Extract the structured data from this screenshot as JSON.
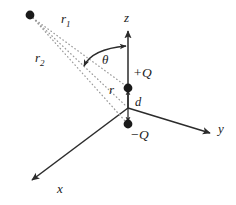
{
  "figure": {
    "type": "physics-diagram",
    "background_color": "#ffffff",
    "stroke_color": "#2b2b2b",
    "dotted_color": "#9a9a9a",
    "width": 236,
    "height": 205
  },
  "axes": [
    {
      "name": "z",
      "label": "z",
      "label_x": 124,
      "label_y": 11,
      "direction": "up",
      "tip_x": 128,
      "tip_y": 30,
      "origin_x": 128,
      "origin_y": 108
    },
    {
      "name": "y",
      "label": "y",
      "label_x": 218,
      "label_y": 122,
      "direction": "down-right",
      "tip_x": 212,
      "tip_y": 134,
      "origin_x": 128,
      "origin_y": 108
    },
    {
      "name": "x",
      "label": "x",
      "label_x": 57,
      "label_y": 182,
      "direction": "down-left",
      "tip_x": 30,
      "tip_y": 181,
      "origin_x": 128,
      "origin_y": 108
    }
  ],
  "charges": [
    {
      "name": "positive-charge",
      "label": "+Q",
      "sign": "+",
      "x": 128,
      "y": 88,
      "label_x": 133,
      "label_y": 66
    },
    {
      "name": "negative-charge",
      "label": "−Q",
      "sign": "−",
      "x": 128,
      "y": 124,
      "label_x": 130,
      "label_y": 128
    }
  ],
  "field_point": {
    "name": "field-point",
    "x": 30,
    "y": 15,
    "radius": 4.2
  },
  "distance_labels": [
    {
      "name": "r1",
      "base": "r",
      "sub": "1",
      "label_x": 62,
      "label_y": 13,
      "from": "field-point",
      "to": "positive-charge"
    },
    {
      "name": "r2",
      "base": "r",
      "sub": "2",
      "label_x": 36,
      "label_y": 52,
      "from": "field-point",
      "to": "negative-charge"
    },
    {
      "name": "r",
      "base": "r",
      "sub": "",
      "label_x": 109,
      "label_y": 83,
      "from": "field-point",
      "to": "origin"
    }
  ],
  "angle": {
    "name": "theta",
    "label": "θ",
    "label_x": 103,
    "label_y": 54,
    "arc_from_x": 84,
    "arc_from_y": 65,
    "arc_to_x": 126,
    "arc_to_y": 46
  },
  "separation": {
    "name": "dipole-separation",
    "label": "d",
    "label_x": 135,
    "label_y": 96,
    "from_x": 128,
    "from_y": 124,
    "to_x": 128,
    "to_y": 88
  }
}
